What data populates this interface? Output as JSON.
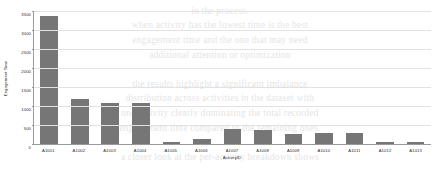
{
  "chart_data": {
    "type": "bar",
    "title": "",
    "xlabel": "ActivityID",
    "ylabel": "Engagement Time",
    "categories": [
      "A1001",
      "A1002",
      "A1003",
      "A1004",
      "A1005",
      "A1006",
      "A1007",
      "A1008",
      "A1009",
      "A1010",
      "A1011",
      "A1012",
      "A1013"
    ],
    "values": [
      3380,
      1190,
      1070,
      1090,
      60,
      130,
      400,
      370,
      265,
      290,
      290,
      60,
      55
    ],
    "ylim": [
      0,
      3500
    ],
    "yticks": [
      0,
      500,
      1000,
      1500,
      2000,
      2500,
      3000,
      3500
    ],
    "ytick_labels": [
      "0",
      "500",
      "1000",
      "1500",
      "2000",
      "2500",
      "3000",
      "3500"
    ],
    "grid": true,
    "legend": false,
    "bar_color": "#767676",
    "axis_color": "#9a9a9a",
    "grid_color": "#e2e2e2"
  },
  "background_text": {
    "lines": [
      "in the process.",
      "when  activity  has   the  lowest   time  is  the  best",
      "engagement time  and  the  one  that  may  need",
      "additional attention  or  optimization",
      "",
      "the  results  highlight  a  significant  imbalance",
      "distribution across  activities  in  the  dataset  with",
      "one  activity  clearly  dominating  the  total  recorded",
      "engagement  time  compared  to  the  remaining  ones.",
      "",
      "a  closer  look  at  the  per-activity  breakdown  shows"
    ]
  }
}
